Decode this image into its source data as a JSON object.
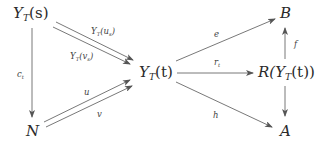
{
  "nodes": {
    "ys": {
      "base": "Y",
      "sub": "T",
      "arg": "(s)"
    },
    "yt": {
      "base": "Y",
      "sub": "T",
      "arg": "(t)"
    },
    "b": "B",
    "r": {
      "prefix": "R(",
      "base": "Y",
      "sub": "T",
      "arg": "(t))"
    },
    "n": "N",
    "a": "A"
  },
  "arrows": {
    "ys_yt_upper": {
      "base": "Y",
      "sub": "T",
      "arg": "(u",
      "argsub": "s",
      "close": ")"
    },
    "ys_yt_lower": {
      "base": "Y",
      "sub": "T",
      "arg": "(v",
      "argsub": "s",
      "close": ")"
    },
    "ys_n": {
      "base": "c",
      "sub": "t"
    },
    "n_yt_upper": "u",
    "n_yt_lower": "v",
    "yt_b": "e",
    "yt_r": {
      "base": "r",
      "sub": "t"
    },
    "yt_a": "h",
    "r_b": "f",
    "r_a": ""
  },
  "colors": {
    "stroke": "#555555",
    "text": "#2a2a2a"
  }
}
